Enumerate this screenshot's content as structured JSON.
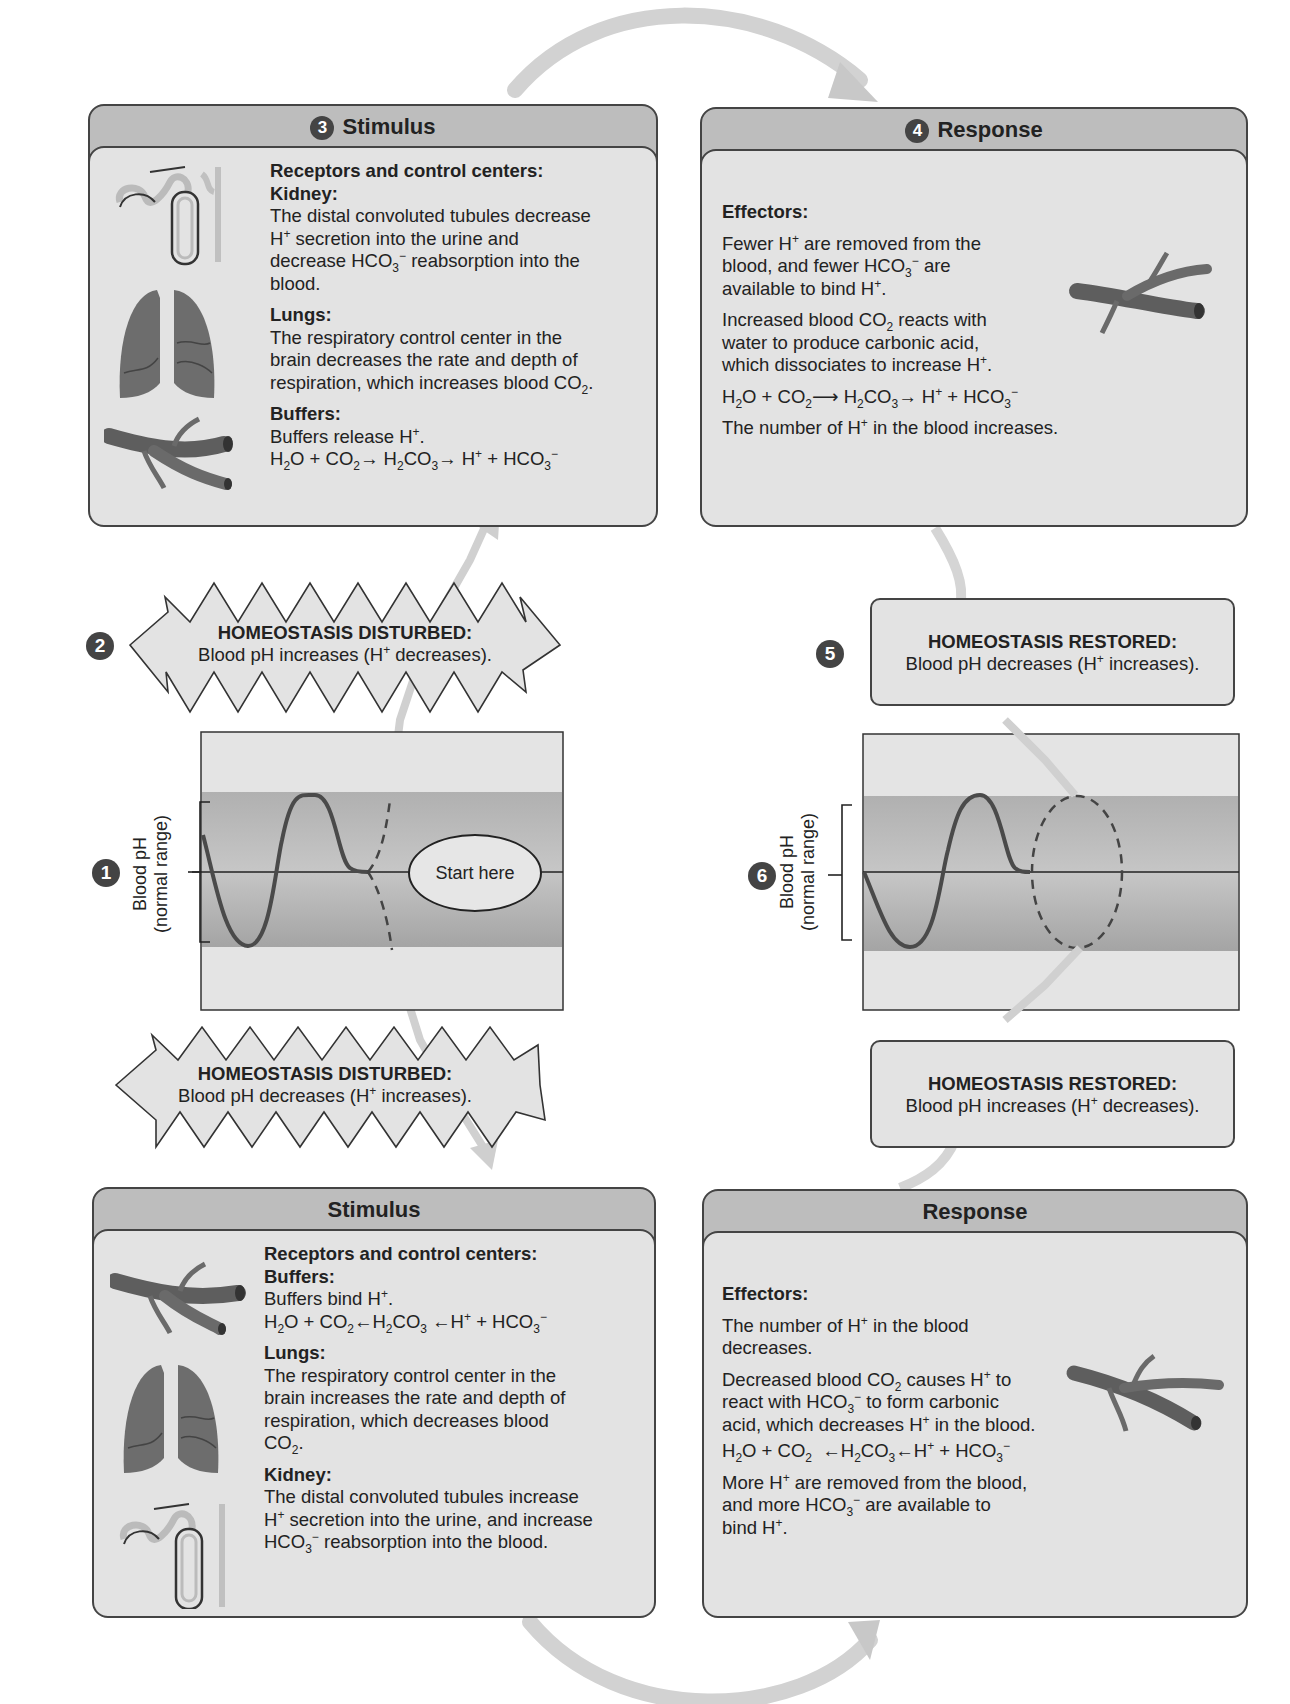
{
  "figure": {
    "top_loop": {
      "step3_stimulus": {
        "step_number": "3",
        "title": "Stimulus",
        "section_heading": "Receptors and control centers:",
        "kidney": {
          "heading": "Kidney:",
          "text_1": "The distal convoluted tubules decrease",
          "text_2": "H",
          "text_2_sup": "+",
          "text_2_rest": " secretion into the urine and",
          "text_3": "decrease HCO",
          "text_3_sub": "3",
          "text_3_sup": "−",
          "text_3_rest": " reabsorption into the",
          "text_4": "blood."
        },
        "lungs": {
          "heading": "Lungs:",
          "text_1": "The respiratory control center in the",
          "text_2": "brain decreases the rate and depth of",
          "text_3": "respiration, which increases blood CO",
          "text_3_sub": "2",
          "text_3_end": "."
        },
        "buffers": {
          "heading": "Buffers:",
          "text_1": "Buffers release H",
          "text_1_sup": "+",
          "text_1_end": ".",
          "equation": "H2O + CO2 → H2CO3 → H+ + HCO3−"
        }
      },
      "step4_response": {
        "step_number": "4",
        "title": "Response",
        "heading": "Effectors:",
        "para1_a": "Fewer H",
        "para1_a_sup": "+",
        "para1_b": " are removed from the",
        "para1_c": "blood, and fewer HCO",
        "para1_c_sub": "3",
        "para1_c_sup": "−",
        "para1_d": " are",
        "para1_e": "available to bind H",
        "para1_e_sup": "+",
        "para1_f": ".",
        "para2_a": "Increased blood CO",
        "para2_a_sub": "2",
        "para2_b": " reacts with",
        "para2_c": "water to produce carbonic acid,",
        "para2_d": "which dissociates to increase H",
        "para2_d_sup": "+",
        "para2_e": ".",
        "equation": "H2O + CO2 → H2CO3 → H+ + HCO3−",
        "para3_a": "The number of H",
        "para3_a_sup": "+",
        "para3_b": " in the blood increases."
      },
      "step2_disturbed": {
        "step_number": "2",
        "heading": "HOMEOSTASIS DISTURBED:",
        "text_a": "Blood pH increases (H",
        "text_sup": "+",
        "text_b": " decreases)."
      },
      "step5_restored": {
        "step_number": "5",
        "heading": "HOMEOSTASIS RESTORED:",
        "text_a": "Blood pH decreases (H",
        "text_sup": "+",
        "text_b": " increases)."
      }
    },
    "graphs": {
      "left": {
        "step_number": "1",
        "ylabel_line1": "Blood pH",
        "ylabel_line2": "(normal range)",
        "start_label": "Start here"
      },
      "right": {
        "step_number": "6",
        "ylabel_line1": "Blood pH",
        "ylabel_line2": "(normal range)"
      }
    },
    "bottom_loop": {
      "disturbed": {
        "heading": "HOMEOSTASIS DISTURBED:",
        "text_a": "Blood pH decreases (H",
        "text_sup": "+",
        "text_b": " increases)."
      },
      "restored": {
        "heading": "HOMEOSTASIS RESTORED:",
        "text_a": "Blood pH increases (H",
        "text_sup": "+",
        "text_b": " decreases)."
      },
      "stimulus": {
        "title": "Stimulus",
        "section_heading": "Receptors and control centers:",
        "buffers": {
          "heading": "Buffers:",
          "text_1": "Buffers bind H",
          "text_1_sup": "+",
          "text_1_end": ".",
          "equation": "H2O + CO2 ← H2CO3 ← H+ + HCO3−"
        },
        "lungs": {
          "heading": "Lungs:",
          "text_1": "The respiratory control center in the",
          "text_2": "brain increases the rate and depth of",
          "text_3": "respiration, which decreases blood",
          "text_4": "CO",
          "text_4_sub": "2",
          "text_4_end": "."
        },
        "kidney": {
          "heading": "Kidney:",
          "text_1": "The distal convoluted tubules increase",
          "text_2": "H",
          "text_2_sup": "+",
          "text_2_rest": " secretion into the urine, and increase",
          "text_3": "HCO",
          "text_3_sub": "3",
          "text_3_sup": "−",
          "text_3_rest": " reabsorption into the blood."
        }
      },
      "response": {
        "title": "Response",
        "heading": "Effectors:",
        "para1_a": "The number of H",
        "para1_a_sup": "+",
        "para1_b": " in the blood",
        "para1_c": "decreases.",
        "para2_a": "Decreased blood CO",
        "para2_a_sub": "2",
        "para2_b": " causes H",
        "para2_b_sup": "+",
        "para2_c": " to",
        "para2_d": "react with HCO",
        "para2_d_sub": "3",
        "para2_d_sup": "−",
        "para2_e": " to form carbonic",
        "para2_f": "acid, which decreases H",
        "para2_f_sup": "+",
        "para2_g": " in the blood.",
        "equation": "H2O + CO2 ← H2CO3 ← H+ + HCO3−",
        "para3_a": "More H",
        "para3_a_sup": "+",
        "para3_b": " are removed from the blood,",
        "para3_c": "and more HCO",
        "para3_c_sub": "3",
        "para3_c_sup": "−",
        "para3_d": " are available to",
        "para3_e": "bind H",
        "para3_e_sup": "+",
        "para3_f": "."
      }
    },
    "colors": {
      "panel_header": "#bdbdbd",
      "panel_body": "#e3e3e3",
      "outline": "#444444",
      "normal_band": "#a9a9a9",
      "arrow": "#cfcfcf"
    }
  }
}
